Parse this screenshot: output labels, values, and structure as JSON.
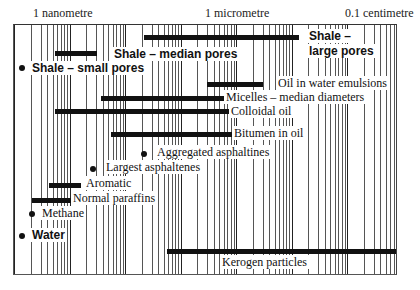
{
  "chart_data": {
    "type": "range-bar",
    "title": "",
    "xscale": "log",
    "xlabel": "Size",
    "ylabel": "",
    "x_axis_ticks": [
      {
        "label": "1 nanometre",
        "value_m": 1e-09
      },
      {
        "label": "1 micrometre",
        "value_m": 1e-06
      },
      {
        "label": "0.1 centimetre",
        "value_m": 0.001
      }
    ],
    "xlim_m": [
      1e-10,
      0.01
    ],
    "grid": true,
    "series": [
      {
        "name": "Shale – large pores",
        "min_m": 1e-08,
        "max_m": 5e-07,
        "style": "sans-bold",
        "row": 0
      },
      {
        "name": "Shale – median pores",
        "min_m": 3e-10,
        "max_m": 1e-09,
        "style": "sans-bold",
        "row": 1
      },
      {
        "name": "Shale – small pores",
        "min_m": 2e-10,
        "max_m": 2e-10,
        "style": "sans-bold",
        "marker": "dot",
        "row": 2
      },
      {
        "name": "Oil in water emulsions",
        "min_m": 2e-07,
        "max_m": 1e-06,
        "style": "serif",
        "row": 3
      },
      {
        "name": "Micelles – median diameters",
        "min_m": 5e-09,
        "max_m": 5e-07,
        "style": "serif",
        "row": 4
      },
      {
        "name": "Colloidal oil",
        "min_m": 1e-09,
        "max_m": 1e-06,
        "style": "serif",
        "row": 5
      },
      {
        "name": "Bitumen in oil",
        "min_m": 1e-08,
        "max_m": 1e-06,
        "style": "serif",
        "row": 6
      },
      {
        "name": "Aggregated asphaltines",
        "min_m": 2e-08,
        "max_m": 2e-08,
        "marker": "dot",
        "style": "serif",
        "row": 7
      },
      {
        "name": "Largest asphaltenes",
        "min_m": 5e-09,
        "max_m": 5e-09,
        "marker": "dot",
        "style": "serif",
        "row": 8
      },
      {
        "name": "Aromatic",
        "min_m": 5e-10,
        "max_m": 1e-09,
        "style": "serif",
        "row": 9
      },
      {
        "name": "Normal paraffins",
        "min_m": 4e-10,
        "max_m": 1.5e-09,
        "style": "serif",
        "row": 10
      },
      {
        "name": "Methane",
        "min_m": 4e-10,
        "max_m": 4e-10,
        "marker": "dot",
        "style": "serif",
        "row": 11
      },
      {
        "name": "Water",
        "min_m": 2e-10,
        "max_m": 2e-10,
        "marker": "dot",
        "style": "sans-bold",
        "row": 12
      },
      {
        "name": "Kerogen particles",
        "min_m": 1e-07,
        "max_m": 0.01,
        "style": "serif",
        "row": 13
      }
    ]
  },
  "axis": {
    "tick_1": "1 nanometre",
    "tick_2": "1 micrometre",
    "tick_3": "0.1 centimetre"
  },
  "labels": {
    "shale_large_1": "Shale –",
    "shale_large_2": "large pores",
    "shale_median": "Shale – median pores",
    "shale_small": "Shale – small pores",
    "oil_water": "Oil in water emulsions",
    "micelles": "Micelles – median diameters",
    "colloidal": "Colloidal oil",
    "bitumen": "Bitumen in oil",
    "aggregated": "Aggregated asphaltines",
    "largest": "Largest asphaltenes",
    "aromatic": "Aromatic",
    "paraffins": "Normal paraffins",
    "methane": "Methane",
    "water": "Water",
    "kerogen": "Kerogen particles"
  }
}
